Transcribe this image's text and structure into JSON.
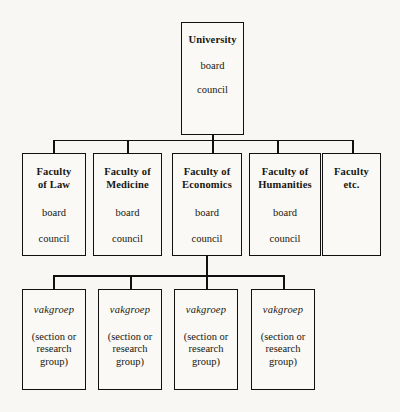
{
  "diagram": {
    "background_color": "#f8f7f3",
    "line_color": "#111010",
    "root": {
      "name": "University",
      "lines": [
        "board",
        "council"
      ]
    },
    "faculties": [
      {
        "name": "Faculty\nof Law",
        "lines": [
          "board",
          "council"
        ]
      },
      {
        "name": "Faculty of\nMedicine",
        "lines": [
          "board",
          "council"
        ]
      },
      {
        "name": "Faculty of\nEconomics",
        "lines": [
          "board",
          "council"
        ]
      },
      {
        "name": "Faculty of\nHumanities",
        "lines": [
          "board",
          "council"
        ]
      },
      {
        "name": "Faculty\netc.",
        "lines": []
      }
    ],
    "vakgroepen": [
      {
        "name": "vakgroep",
        "lines": [
          "(section or\nresearch\ngroup)"
        ]
      },
      {
        "name": "vakgroep",
        "lines": [
          "(section or\nresearch\ngroup)"
        ]
      },
      {
        "name": "vakgroep",
        "lines": [
          "(section or\nresearch\ngroup)"
        ]
      },
      {
        "name": "vakgroep",
        "lines": [
          "(section or\nresearch\ngroup)"
        ]
      }
    ]
  }
}
